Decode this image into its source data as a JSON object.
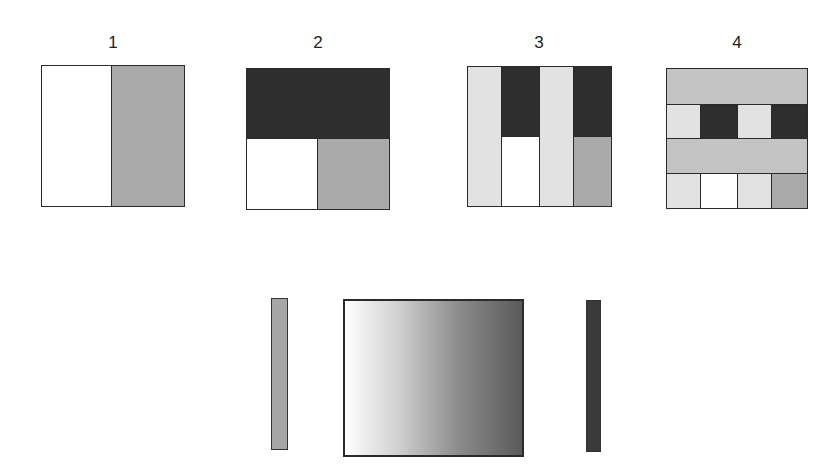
{
  "colors": {
    "white": "#ffffff",
    "light": "#e2e2e2",
    "mid": "#aaaaaa",
    "band": "#c4c4c4",
    "dark": "#2e2e2e",
    "border": "#2a2a2a"
  },
  "panels": [
    {
      "label": "1"
    },
    {
      "label": "2"
    },
    {
      "label": "3"
    },
    {
      "label": "4"
    }
  ],
  "bottom": {
    "left_bar_color": "#a6a6a6",
    "gradient_start": "#ffffff",
    "gradient_end": "#5a5a5a",
    "right_bar_color": "#3a3a3a"
  }
}
